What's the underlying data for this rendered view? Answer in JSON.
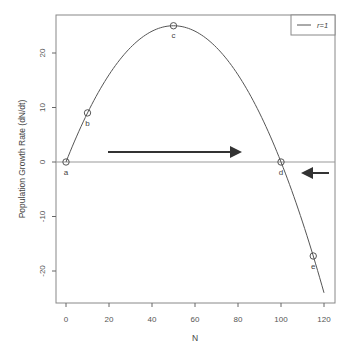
{
  "chart_data": {
    "type": "line",
    "title": "",
    "xlabel": "N",
    "ylabel": "Population Growth Rate (dN/dt)",
    "xlim": [
      -3,
      125
    ],
    "ylim": [
      -26,
      26.5
    ],
    "x_ticks": [
      0,
      20,
      40,
      60,
      80,
      100,
      120
    ],
    "y_ticks": [
      -20,
      -10,
      0,
      10,
      20
    ],
    "grid": false,
    "legend_position": "top-right",
    "series": [
      {
        "name": "r=1",
        "equation": "dN/dt = r*N*(1 - N/100)",
        "x": [
          0,
          10,
          20,
          30,
          40,
          50,
          60,
          70,
          80,
          90,
          100,
          110,
          120
        ],
        "values": [
          0,
          9,
          16,
          21,
          24,
          25,
          24,
          21,
          16,
          9,
          0,
          -11,
          -24
        ],
        "color": "#555555"
      }
    ],
    "marked_points": [
      {
        "label": "a",
        "x": 0,
        "y": 0
      },
      {
        "label": "b",
        "x": 10,
        "y": 9
      },
      {
        "label": "c",
        "x": 50,
        "y": 25
      },
      {
        "label": "d",
        "x": 100,
        "y": 0
      },
      {
        "label": "e",
        "x": 115,
        "y": -17.25
      }
    ],
    "reference_line": {
      "y": 0
    },
    "annotations": [
      {
        "type": "arrow",
        "direction": "right",
        "from_x": 20,
        "to_x": 81,
        "y": 3
      },
      {
        "type": "arrow",
        "direction": "left",
        "from_x": 122,
        "to_x": 109,
        "y": -2
      }
    ]
  },
  "labels": {
    "xlabel": "N",
    "ylabel": "Population Growth Rate (dN/dt)",
    "legend": "r=1",
    "x_ticks": [
      "0",
      "20",
      "40",
      "60",
      "80",
      "100",
      "120"
    ],
    "y_ticks": [
      "20",
      "10",
      "0",
      "-10",
      "-20"
    ],
    "points": [
      "a",
      "b",
      "c",
      "d",
      "e"
    ]
  }
}
